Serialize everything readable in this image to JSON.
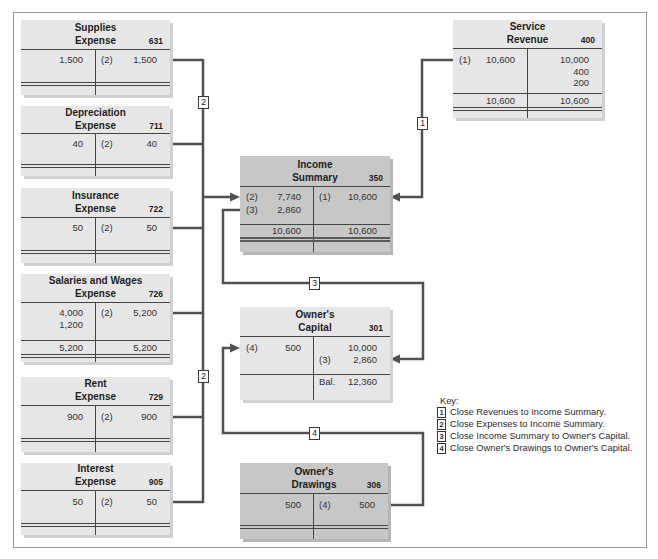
{
  "accounts": {
    "supplies_expense": {
      "title": [
        "Supplies",
        "Expense"
      ],
      "number": "631",
      "rows": [
        {
          "dr_ref": "",
          "dr_amt": "1,500",
          "cr_ref": "(2)",
          "cr_amt": "1,500"
        }
      ]
    },
    "depreciation_expense": {
      "title": [
        "Depreciation",
        "Expense"
      ],
      "number": "711",
      "rows": [
        {
          "dr_ref": "",
          "dr_amt": "40",
          "cr_ref": "(2)",
          "cr_amt": "40"
        }
      ]
    },
    "insurance_expense": {
      "title": [
        "Insurance",
        "Expense"
      ],
      "number": "722",
      "rows": [
        {
          "dr_ref": "",
          "dr_amt": "50",
          "cr_ref": "(2)",
          "cr_amt": "50"
        }
      ]
    },
    "salaries_wages_expense": {
      "title": [
        "Salaries and Wages",
        "Expense"
      ],
      "number": "726",
      "rows": [
        {
          "dr_ref": "",
          "dr_amt": "4,000",
          "cr_ref": "(2)",
          "cr_amt": "5,200"
        },
        {
          "dr_ref": "",
          "dr_amt": "1,200",
          "cr_ref": "",
          "cr_amt": ""
        }
      ],
      "totals": {
        "dr_amt": "5,200",
        "cr_amt": "5,200"
      }
    },
    "rent_expense": {
      "title": [
        "Rent",
        "Expense"
      ],
      "number": "729",
      "rows": [
        {
          "dr_ref": "",
          "dr_amt": "900",
          "cr_ref": "(2)",
          "cr_amt": "900"
        }
      ]
    },
    "interest_expense": {
      "title": [
        "Interest",
        "Expense"
      ],
      "number": "905",
      "rows": [
        {
          "dr_ref": "",
          "dr_amt": "50",
          "cr_ref": "(2)",
          "cr_amt": "50"
        }
      ]
    },
    "service_revenue": {
      "title": [
        "Service",
        "Revenue"
      ],
      "number": "400",
      "rows": [
        {
          "dr_ref": "(1)",
          "dr_amt": "10,600",
          "cr_ref": "",
          "cr_amt": "10,000"
        },
        {
          "dr_ref": "",
          "dr_amt": "",
          "cr_ref": "",
          "cr_amt": "400"
        },
        {
          "dr_ref": "",
          "dr_amt": "",
          "cr_ref": "",
          "cr_amt": "200"
        }
      ],
      "totals": {
        "dr_amt": "10,600",
        "cr_amt": "10,600"
      }
    },
    "income_summary": {
      "title": [
        "Income",
        "Summary"
      ],
      "number": "350",
      "rows": [
        {
          "dr_ref": "(2)",
          "dr_amt": "7,740",
          "cr_ref": "(1)",
          "cr_amt": "10,600"
        },
        {
          "dr_ref": "(3)",
          "dr_amt": "2,860",
          "cr_ref": "",
          "cr_amt": ""
        }
      ],
      "totals": {
        "dr_amt": "10,600",
        "cr_amt": "10,600"
      }
    },
    "owners_capital": {
      "title": [
        "Owner's",
        "Capital"
      ],
      "number": "301",
      "rows": [
        {
          "dr_ref": "(4)",
          "dr_amt": "500",
          "cr_ref": "",
          "cr_amt": "10,000"
        },
        {
          "dr_ref": "",
          "dr_amt": "",
          "cr_ref": "(3)",
          "cr_amt": "2,860"
        }
      ],
      "balance": {
        "cr_ref": "Bal.",
        "cr_amt": "12,360"
      }
    },
    "owners_drawings": {
      "title": [
        "Owner's",
        "Drawings"
      ],
      "number": "306",
      "rows": [
        {
          "dr_ref": "",
          "dr_amt": "500",
          "cr_ref": "(4)",
          "cr_amt": "500"
        }
      ]
    }
  },
  "connector_labels": {
    "expenses_upper": "2",
    "expenses_lower": "2",
    "revenues": "1",
    "income_summary_to_capital": "3",
    "drawings_to_capital": "4"
  },
  "key": {
    "title": "Key:",
    "items": [
      {
        "num": "1",
        "text": "Close Revenues to Income Summary."
      },
      {
        "num": "2",
        "text": "Close Expenses to Income Summary."
      },
      {
        "num": "3",
        "text": "Close Income Summary to Owner's Capital."
      },
      {
        "num": "4",
        "text": "Close Owner's Drawings to Owner's Capital."
      }
    ]
  },
  "colors": {
    "account_light": "#e6e6e6",
    "account_dark": "#c7c7c7",
    "connector": "#505050",
    "frame": "#9a9a9a"
  }
}
